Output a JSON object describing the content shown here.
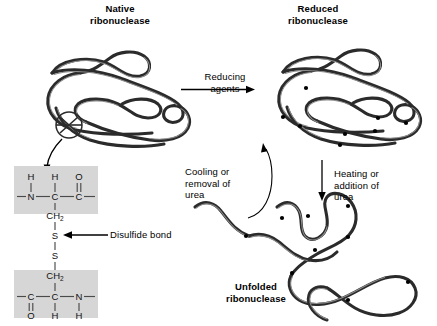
{
  "diagram": {
    "title_native": "Native\nribonuclease",
    "title_reduced": "Reduced\nribonuclease",
    "title_unfolded": "Unfolded\nribonuclease"
  },
  "labels": {
    "native_line1": "Native",
    "native_line2": "ribonuclease",
    "reduced_line1": "Reduced",
    "reduced_line2": "ribonuclease",
    "unfolded_line1": "Unfolded",
    "unfolded_line2": "ribonuclease",
    "reducing_line1": "Reducing",
    "reducing_line2": "agents",
    "cooling_line1": "Cooling or",
    "cooling_line2": "removal of",
    "cooling_line3": "urea",
    "heating_line1": "Heating or",
    "heating_line2": "addition of",
    "heating_line3": "urea",
    "disulfide_bond": "Disulfide bond"
  },
  "chemistry": {
    "top_residue": {
      "upper_atoms": [
        "H",
        "H",
        "O"
      ],
      "backbone_atoms": [
        "N",
        "C",
        "C"
      ],
      "side_chain": "CH",
      "side_chain_sub": "2"
    },
    "bottom_residue": {
      "side_chain": "CH",
      "side_chain_sub": "2",
      "backbone_atoms": [
        "C",
        "C",
        "N"
      ],
      "lower_atoms": [
        "O",
        "H",
        "H"
      ]
    },
    "sulfur_top": "S",
    "sulfur_bottom": "S"
  },
  "colors": {
    "chain": "#2b2b2b",
    "chain_highlight": "#8d8d8d",
    "residue_box": "#d6d6d6",
    "background": "#ffffff",
    "text": "#000000"
  }
}
